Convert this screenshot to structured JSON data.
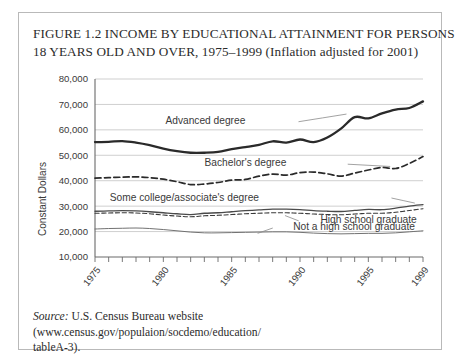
{
  "figure": {
    "title_line1": "FIGURE 1.2  INCOME BY EDUCATIONAL ATTAINMENT FOR PERSONS",
    "title_line2": "18 YEARS OLD AND OVER, 1975–1999 (Inflation adjusted for 2001)",
    "title_number": "FIGURE 1.2",
    "border_color": "#b9b9b9"
  },
  "source": {
    "label": "Source:",
    "text": " U.S. Census Bureau website (www.census.gov/populaion/socdemo/education/",
    "text_line2": "tableA-3)."
  },
  "chart_data": {
    "type": "line",
    "title": "Income by Educational Attainment for Persons 18 Years Old and Over, 1975–1999 (Inflation adjusted for 2001)",
    "xlabel": "",
    "ylabel": "Constant Dollars",
    "grid": true,
    "legend_position": "inline-annotations",
    "xlim": [
      1975,
      1999
    ],
    "ylim": [
      10000,
      80000
    ],
    "ytick_labels": [
      "10,000",
      "20,000",
      "30,000",
      "40,000",
      "50,000",
      "60,000",
      "70,000",
      "80,000"
    ],
    "ytick_values": [
      10000,
      20000,
      30000,
      40000,
      50000,
      60000,
      70000,
      80000
    ],
    "xtick_labels": [
      "1975",
      "1980",
      "1985",
      "1990",
      "1995",
      "1999"
    ],
    "xtick_values": [
      1975,
      1980,
      1985,
      1990,
      1995,
      1999
    ],
    "x": [
      1975,
      1976,
      1977,
      1978,
      1979,
      1980,
      1981,
      1982,
      1983,
      1984,
      1985,
      1986,
      1987,
      1988,
      1989,
      1990,
      1991,
      1992,
      1993,
      1994,
      1995,
      1996,
      1997,
      1998,
      1999
    ],
    "series": [
      {
        "name": "Advanced degree",
        "style": "thick-solid",
        "color": "#2a2a2a",
        "values": [
          55200,
          55300,
          55600,
          55000,
          54000,
          52600,
          51600,
          51000,
          51000,
          51300,
          52400,
          53200,
          54100,
          55500,
          55000,
          56200,
          55200,
          57000,
          60500,
          65000,
          64500,
          66500,
          68000,
          68600,
          71200
        ]
      },
      {
        "name": "Bachelor's degree",
        "style": "dashed",
        "color": "#2a2a2a",
        "values": [
          41000,
          41200,
          41400,
          41500,
          41200,
          40600,
          39600,
          38500,
          38700,
          39300,
          40200,
          40500,
          41800,
          42600,
          42200,
          43200,
          43400,
          42700,
          41800,
          43000,
          44200,
          45200,
          44800,
          46800,
          49500
        ]
      },
      {
        "name": "Some college/associate's degree",
        "style": "solid",
        "color": "#4a4a4a",
        "values": [
          28000,
          28100,
          28200,
          28100,
          27800,
          27400,
          27000,
          26700,
          27200,
          27400,
          27800,
          28200,
          28500,
          28800,
          28800,
          28600,
          28200,
          28000,
          27900,
          28300,
          28700,
          28600,
          29200,
          30000,
          30600
        ]
      },
      {
        "name": "High school graduate",
        "style": "thin-dashed",
        "color": "#3a3a3a",
        "values": [
          27200,
          27300,
          27400,
          27300,
          27000,
          26500,
          26100,
          25800,
          26200,
          26400,
          26700,
          27000,
          27200,
          27400,
          27400,
          27200,
          26900,
          26700,
          26600,
          26900,
          27200,
          27200,
          27600,
          28300,
          29000
        ]
      },
      {
        "name": "Not a high school graduate",
        "style": "thin-solid",
        "color": "#6a6a6a",
        "values": [
          21000,
          21200,
          21300,
          21400,
          21200,
          20800,
          20300,
          19800,
          19500,
          19500,
          19600,
          19700,
          19800,
          19900,
          19900,
          19700,
          19400,
          19200,
          19100,
          19200,
          19300,
          19300,
          19500,
          19900,
          20300
        ]
      }
    ],
    "annotations": [
      {
        "label": "Advanced degree",
        "x": 1986.0,
        "y": 63500
      },
      {
        "label": "Bachelor's degree",
        "x": 1989.0,
        "y": 47000
      },
      {
        "label": "Some college/associate's degree",
        "x": 1987.0,
        "y": 33500
      },
      {
        "label": "High school graduate",
        "x": 1991.5,
        "y": 24600
      },
      {
        "label": "Not a high school graduate",
        "x": 1989.5,
        "y": 21800
      }
    ]
  }
}
